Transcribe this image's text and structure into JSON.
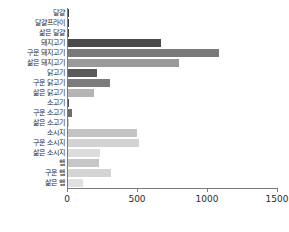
{
  "chart_data": {
    "type": "bar",
    "orientation": "horizontal",
    "title": "",
    "xlabel": "",
    "ylabel": "",
    "xlim": [
      0,
      1500
    ],
    "xticks": [
      0,
      500,
      1000,
      1500
    ],
    "xtick_labels": [
      "0",
      "500",
      "1000",
      "1500"
    ],
    "grid": false,
    "legend": "none",
    "categories": [
      "달걀",
      "달걀프라이",
      "삶은 달걀",
      "돼지고기",
      "구운 돼지고기",
      "삶은 돼지고기",
      "닭고기",
      "구운 닭고기",
      "삶은 닭고기",
      "소고기",
      "구운 소고기",
      "삶은 소고기",
      "소시지",
      "구운 소시지",
      "삶은 소시지",
      "햄",
      "구운 햄",
      "삶은 햄"
    ],
    "values": [
      10,
      8,
      6,
      665,
      1080,
      790,
      210,
      300,
      185,
      8,
      25,
      4,
      490,
      510,
      225,
      220,
      305,
      105
    ],
    "bar_colors": [
      "#3a3a3a",
      "#3a3a3a",
      "#4a4a4a",
      "#4a4a4a",
      "#7a7a7a",
      "#9a9a9a",
      "#5a5a5a",
      "#7c7c7c",
      "#b4b4b4",
      "#4e4e4e",
      "#6e6e6e",
      "#c8c8c8",
      "#c4c4c4",
      "#d2d2d2",
      "#dcdcdc",
      "#c6c6c6",
      "#d4d4d4",
      "#e0e0e0"
    ]
  },
  "axis": {
    "x_axis_color": "#7a7a7a",
    "y_axis_color": "#7a7a7a"
  }
}
